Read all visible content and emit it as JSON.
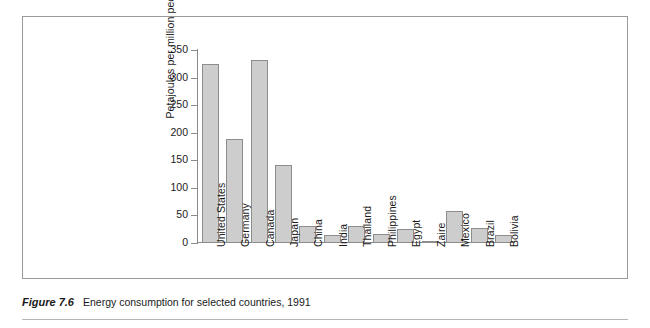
{
  "caption": {
    "figure_number": "Figure 7.6",
    "text": "Energy consumption for selected countries, 1991"
  },
  "colors": {
    "bar_fill": "#cdcdcd",
    "bar_stroke": "#8d8d8d",
    "axis": "#8a8a8a",
    "frame": "#9a9a9a",
    "text": "#1a1a1a",
    "background": "#ffffff"
  },
  "chart_data": {
    "type": "bar",
    "title": "",
    "xlabel": "",
    "ylabel": "Petajoules per million people",
    "ylim": [
      0,
      350
    ],
    "yticks": [
      0,
      50,
      100,
      150,
      200,
      250,
      300,
      350
    ],
    "ytick_labels": [
      "0",
      "50",
      "100",
      "150",
      "200",
      "250",
      "300",
      "350"
    ],
    "grid": false,
    "legend": false,
    "orientation": "vertical",
    "categories": [
      "United States",
      "Germany",
      "Canada",
      "Japan",
      "China",
      "India",
      "Thailand",
      "Philippines",
      "Egypt",
      "Zaire",
      "Mexico",
      "Brazil",
      "Bolivia"
    ],
    "values": [
      324,
      189,
      332,
      142,
      30,
      14,
      30,
      16,
      26,
      2,
      58,
      27,
      14
    ]
  }
}
